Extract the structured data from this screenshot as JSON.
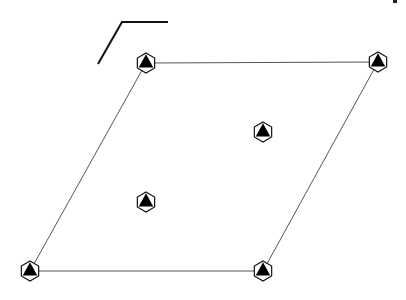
{
  "diagram": {
    "type": "2D hexagonal lattice unit cell with sixfold symmetry symbols",
    "background": "#ffffff",
    "line_color": "#555555",
    "symbol_fill": "#000000",
    "axis_marker": {
      "points": [
        [
          98,
          64
        ],
        [
          122,
          22
        ],
        [
          168,
          22
        ]
      ],
      "stroke": "#111111",
      "width": 2
    },
    "cell_edges": [
      {
        "from": [
          146,
          63
        ],
        "to": [
          378,
          62
        ]
      },
      {
        "from": [
          378,
          62
        ],
        "to": [
          263,
          271
        ]
      },
      {
        "from": [
          263,
          271
        ],
        "to": [
          30,
          271
        ]
      },
      {
        "from": [
          30,
          271
        ],
        "to": [
          146,
          63
        ]
      }
    ],
    "symbols": [
      {
        "name": "corner-top-left",
        "x": 146,
        "y": 63,
        "symbol": "six-fold-rotoinversion"
      },
      {
        "name": "corner-top-right",
        "x": 378,
        "y": 62,
        "symbol": "six-fold-rotoinversion"
      },
      {
        "name": "corner-bottom-left",
        "x": 30,
        "y": 271,
        "symbol": "six-fold-rotoinversion"
      },
      {
        "name": "corner-bottom-right",
        "x": 263,
        "y": 271,
        "symbol": "six-fold-rotoinversion"
      },
      {
        "name": "interior-upper",
        "x": 263,
        "y": 132,
        "symbol": "six-fold-rotoinversion"
      },
      {
        "name": "interior-lower",
        "x": 146,
        "y": 202,
        "symbol": "six-fold-rotoinversion"
      }
    ],
    "symbol_radius": 10,
    "corner_fragment": {
      "x": 393,
      "y": 0,
      "w": 4,
      "h": 3
    }
  }
}
